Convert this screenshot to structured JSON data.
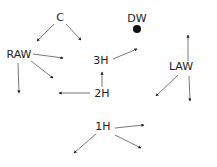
{
  "diagram": {
    "nodes": [
      {
        "id": "C",
        "label": "C",
        "x": 60,
        "y": 21
      },
      {
        "id": "RAW",
        "label": "RAW",
        "x": 19,
        "y": 58
      },
      {
        "id": "DW",
        "label": "DW",
        "x": 137,
        "y": 22,
        "marker": "filled-circle"
      },
      {
        "id": "3H",
        "label": "3H",
        "x": 101,
        "y": 64
      },
      {
        "id": "2H",
        "label": "2H",
        "x": 102,
        "y": 97
      },
      {
        "id": "LAW",
        "label": "LAW",
        "x": 181,
        "y": 70
      },
      {
        "id": "1H",
        "label": "1H",
        "x": 103,
        "y": 130
      }
    ],
    "edges": [
      {
        "from": "C",
        "x1": 54,
        "y1": 24,
        "x2": 37,
        "y2": 41
      },
      {
        "from": "C",
        "x1": 66,
        "y1": 24,
        "x2": 81,
        "y2": 40
      },
      {
        "from": "RAW",
        "x1": 33,
        "y1": 54,
        "x2": 63,
        "y2": 58
      },
      {
        "from": "RAW",
        "x1": 31,
        "y1": 61,
        "x2": 53,
        "y2": 78
      },
      {
        "from": "RAW",
        "x1": 18,
        "y1": 63,
        "x2": 19,
        "y2": 93
      },
      {
        "from": "3H",
        "x1": 113,
        "y1": 59,
        "x2": 137,
        "y2": 49
      },
      {
        "from": "2H",
        "x1": 102,
        "y1": 87,
        "x2": 102,
        "y2": 72
      },
      {
        "from": "2H",
        "x1": 90,
        "y1": 93,
        "x2": 59,
        "y2": 93
      },
      {
        "from": "LAW",
        "x1": 188,
        "y1": 61,
        "x2": 188,
        "y2": 35
      },
      {
        "from": "LAW",
        "x1": 178,
        "y1": 75,
        "x2": 156,
        "y2": 96
      },
      {
        "from": "LAW",
        "x1": 189,
        "y1": 76,
        "x2": 190,
        "y2": 101
      },
      {
        "from": "1H",
        "x1": 115,
        "y1": 128,
        "x2": 144,
        "y2": 125
      },
      {
        "from": "1H",
        "x1": 115,
        "y1": 135,
        "x2": 141,
        "y2": 148
      },
      {
        "from": "1H",
        "x1": 96,
        "y1": 134,
        "x2": 74,
        "y2": 153
      }
    ],
    "dw_marker": {
      "cx": 137,
      "cy": 29,
      "r": 4
    }
  }
}
